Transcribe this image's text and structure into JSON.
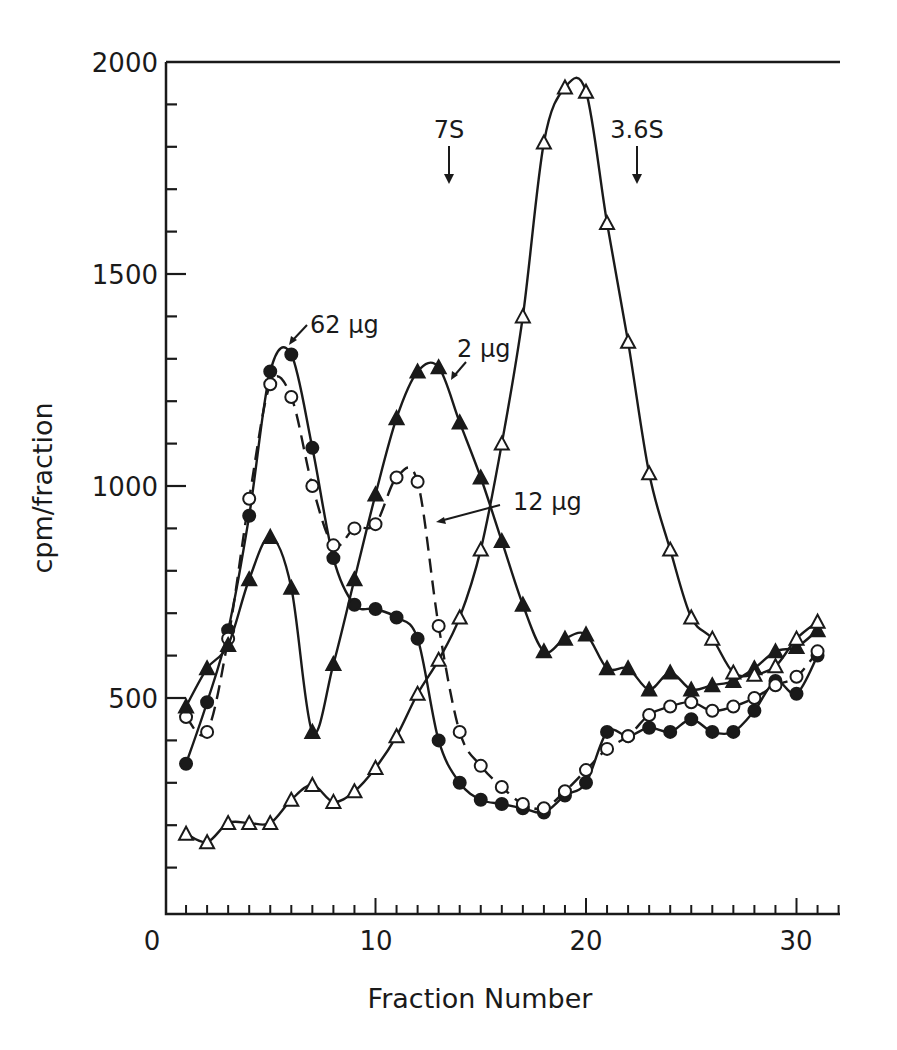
{
  "chart_data": {
    "type": "line",
    "title": "",
    "xlabel": "Fraction Number",
    "ylabel": "cpm/fraction",
    "xlim": [
      0,
      33
    ],
    "ylim": [
      0,
      2000
    ],
    "x_ticks": [
      0,
      10,
      20,
      30
    ],
    "y_ticks": [
      500,
      1000,
      1500,
      2000
    ],
    "grid": false,
    "legend": "inline annotations",
    "x": [
      1,
      2,
      3,
      4,
      5,
      6,
      7,
      8,
      9,
      10,
      11,
      12,
      13,
      14,
      15,
      16,
      17,
      18,
      19,
      20,
      21,
      22,
      23,
      24,
      25,
      26,
      27,
      28,
      29,
      30,
      31
    ],
    "series": [
      {
        "name": "62 µg",
        "marker": "filled-circle",
        "line": "solid",
        "values": [
          345,
          490,
          660,
          930,
          1270,
          1310,
          1090,
          830,
          720,
          710,
          690,
          640,
          400,
          300,
          260,
          250,
          240,
          230,
          270,
          300,
          420,
          410,
          430,
          420,
          450,
          420,
          420,
          470,
          540,
          510,
          600
        ]
      },
      {
        "name": "12 µg",
        "marker": "open-circle",
        "line": "dashed",
        "values": [
          455,
          420,
          640,
          970,
          1240,
          1210,
          1000,
          860,
          900,
          910,
          1020,
          1010,
          670,
          420,
          340,
          290,
          250,
          240,
          280,
          330,
          380,
          410,
          460,
          480,
          490,
          470,
          480,
          500,
          530,
          550,
          610
        ]
      },
      {
        "name": "2 µg",
        "marker": "filled-triangle",
        "line": "solid",
        "values": [
          480,
          570,
          625,
          780,
          880,
          760,
          420,
          580,
          780,
          980,
          1160,
          1270,
          1280,
          1150,
          1020,
          870,
          720,
          610,
          640,
          650,
          570,
          570,
          520,
          560,
          520,
          530,
          540,
          570,
          610,
          620,
          660
        ]
      },
      {
        "name": "control (open triangles)",
        "marker": "open-triangle",
        "line": "solid",
        "values": [
          180,
          160,
          205,
          205,
          205,
          260,
          295,
          255,
          280,
          335,
          410,
          510,
          590,
          690,
          850,
          1100,
          1400,
          1810,
          1940,
          1930,
          1620,
          1340,
          1030,
          850,
          690,
          640,
          560,
          555,
          575,
          640,
          680
        ]
      }
    ],
    "annotations": [
      {
        "text": "7S",
        "x": 13.5,
        "arrow": "down"
      },
      {
        "text": "3.6S",
        "x": 22.5,
        "arrow": "down"
      },
      {
        "text": "62 µg",
        "points_to": "62 µg peak at fraction 6"
      },
      {
        "text": "2 µg",
        "points_to": "2 µg peak at fraction 13"
      },
      {
        "text": "12 µg",
        "points_to": "12 µg dashed curve near fraction 12"
      }
    ]
  },
  "labels": {
    "xlabel": "Fraction Number",
    "ylabel": "cpm/fraction",
    "x_ticks": [
      "0",
      "10",
      "20",
      "30"
    ],
    "y_ticks": [
      "500",
      "1000",
      "1500",
      "2000"
    ],
    "marker_7s": "7S",
    "marker_36s": "3.6S",
    "lbl_62": "62 µg",
    "lbl_2": "2 µg",
    "lbl_12": "12 µg"
  }
}
